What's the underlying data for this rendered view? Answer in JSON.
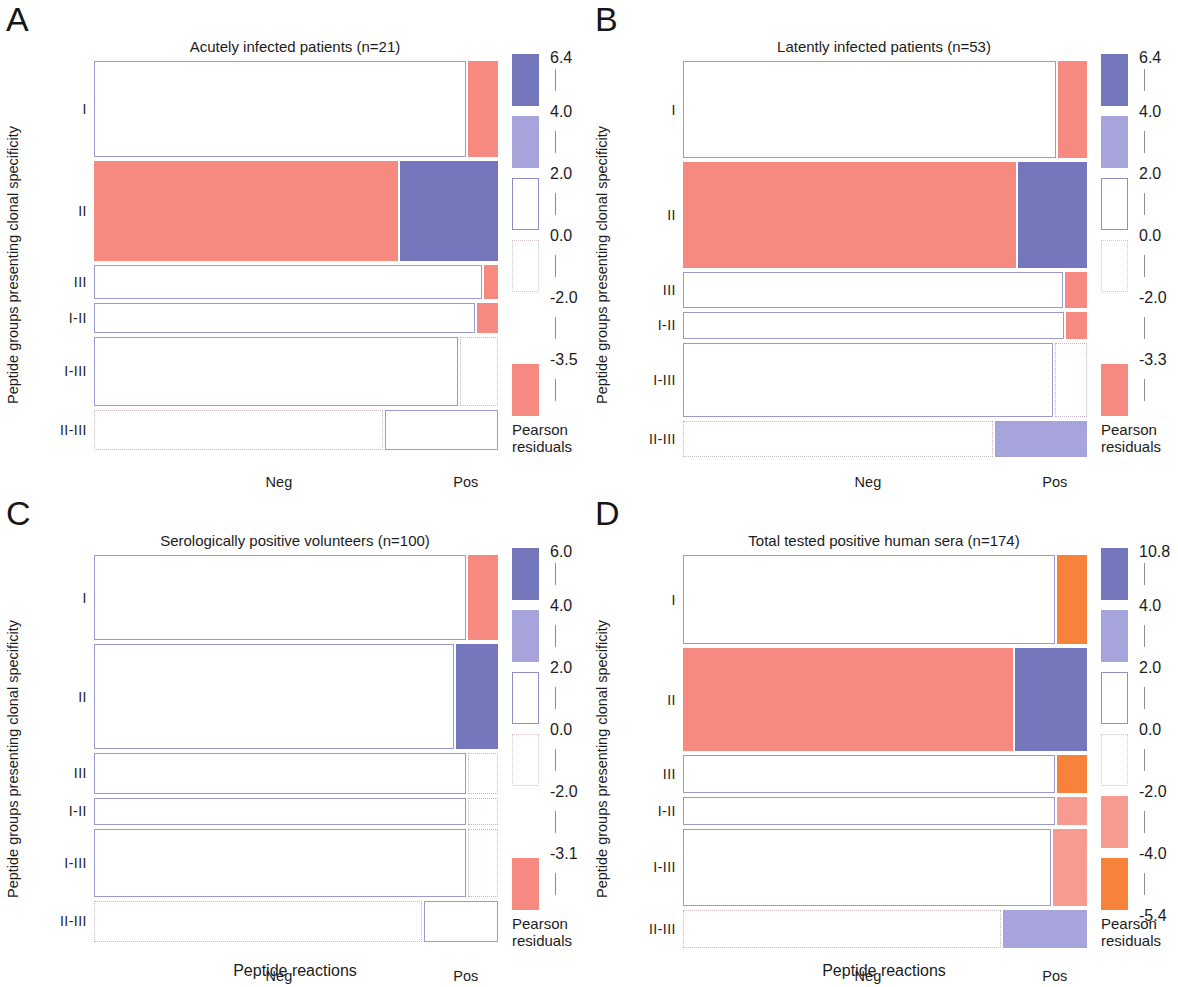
{
  "figure": {
    "xlabel": "Peptide reactions",
    "ylabel": "Peptide groups presenting clonal specificity",
    "xticks": [
      "Neg",
      "Pos"
    ],
    "legend_caption_line1": "Pearson",
    "legend_caption_line2": "residuals",
    "row_categories": [
      "I",
      "II",
      "III",
      "I-II",
      "I-III",
      "II-III"
    ],
    "colors": {
      "dark_blue": "#7577bd",
      "light_blue": "#a6a4db",
      "salmon": "#f68a80",
      "light_salmon": "#f79a90",
      "orange": "#f7823c",
      "white": "#ffffff",
      "solid_outline": "#9a9ad0",
      "dotted_outline": "#cdb6c3"
    }
  },
  "panels": [
    {
      "letter": "A",
      "title": "Acutely infected patients (n=21)",
      "legend": {
        "ticks": [
          "6.4",
          "4.0",
          "2.0",
          "0.0",
          "-2.0",
          "-3.5"
        ],
        "bands": [
          "dark_blue",
          "light_blue",
          "white_solid",
          "white_dotted",
          "gap",
          "salmon"
        ]
      },
      "chart_data": {
        "type": "mosaic",
        "title": "Acutely infected patients (n=21)",
        "xlabel": "Peptide reactions",
        "ylabel": "Peptide groups presenting clonal specificity",
        "columns": [
          "Neg",
          "Pos"
        ],
        "rows": [
          "I",
          "II",
          "III",
          "I-II",
          "I-III",
          "II-III"
        ],
        "row_heights_pct": [
          24.8,
          25.8,
          8.8,
          7.6,
          17.7,
          10.5
        ],
        "cells": [
          {
            "row": "I",
            "col": "Neg",
            "width_pct": 92.5,
            "residual_band": "0 to 2",
            "fill": "white",
            "border": "solid"
          },
          {
            "row": "I",
            "col": "Pos",
            "width_pct": 7.5,
            "residual_band": "-3.5 to -2",
            "fill": "salmon",
            "border": "none"
          },
          {
            "row": "II",
            "col": "Neg",
            "width_pct": 75.6,
            "residual_band": "-3.5 to -2",
            "fill": "salmon",
            "border": "none"
          },
          {
            "row": "II",
            "col": "Pos",
            "width_pct": 24.4,
            "residual_band": "4 to 6.4",
            "fill": "dark_blue",
            "border": "none"
          },
          {
            "row": "III",
            "col": "Neg",
            "width_pct": 96.5,
            "residual_band": "0 to 2",
            "fill": "white",
            "border": "solid"
          },
          {
            "row": "III",
            "col": "Pos",
            "width_pct": 3.5,
            "residual_band": "-3.5 to -2",
            "fill": "salmon",
            "border": "none"
          },
          {
            "row": "I-II",
            "col": "Neg",
            "width_pct": 94.8,
            "residual_band": "0 to 2",
            "fill": "white",
            "border": "solid"
          },
          {
            "row": "I-II",
            "col": "Pos",
            "width_pct": 5.2,
            "residual_band": "-3.5 to -2",
            "fill": "salmon",
            "border": "none"
          },
          {
            "row": "I-III",
            "col": "Neg",
            "width_pct": 90.5,
            "residual_band": "0 to 2",
            "fill": "white",
            "border": "solid"
          },
          {
            "row": "I-III",
            "col": "Pos",
            "width_pct": 9.5,
            "residual_band": "-2 to 0",
            "fill": "white",
            "border": "dotted"
          },
          {
            "row": "II-III",
            "col": "Neg",
            "width_pct": 72.0,
            "residual_band": "-2 to 0",
            "fill": "white",
            "border": "dotted"
          },
          {
            "row": "II-III",
            "col": "Pos",
            "width_pct": 28.0,
            "residual_band": "0 to 2",
            "fill": "white",
            "border": "solid"
          }
        ]
      }
    },
    {
      "letter": "B",
      "title": "Latently infected patients (n=53)",
      "legend": {
        "ticks": [
          "6.4",
          "4.0",
          "2.0",
          "0.0",
          "-2.0",
          "-3.3"
        ],
        "bands": [
          "dark_blue",
          "light_blue",
          "white_solid",
          "white_dotted",
          "gap",
          "salmon"
        ]
      },
      "chart_data": {
        "type": "mosaic",
        "title": "Latently infected patients (n=53)",
        "xlabel": "Peptide reactions",
        "ylabel": "Peptide groups presenting clonal specificity",
        "columns": [
          "Neg",
          "Pos"
        ],
        "rows": [
          "I",
          "II",
          "III",
          "I-II",
          "I-III",
          "II-III"
        ],
        "row_heights_pct": [
          25.0,
          27.2,
          9.3,
          7.1,
          19.1,
          9.3
        ],
        "cells": [
          {
            "row": "I",
            "col": "Neg",
            "width_pct": 92.8,
            "residual_band": "0 to 2",
            "fill": "white",
            "border": "solid"
          },
          {
            "row": "I",
            "col": "Pos",
            "width_pct": 7.2,
            "residual_band": "-3.3 to -2",
            "fill": "salmon",
            "border": "none"
          },
          {
            "row": "II",
            "col": "Neg",
            "width_pct": 82.8,
            "residual_band": "-3.3 to -2",
            "fill": "salmon",
            "border": "none"
          },
          {
            "row": "II",
            "col": "Pos",
            "width_pct": 17.2,
            "residual_band": "4 to 6.4",
            "fill": "dark_blue",
            "border": "none"
          },
          {
            "row": "III",
            "col": "Neg",
            "width_pct": 94.5,
            "residual_band": "0 to 2",
            "fill": "white",
            "border": "solid"
          },
          {
            "row": "III",
            "col": "Pos",
            "width_pct": 5.5,
            "residual_band": "-3.3 to -2",
            "fill": "salmon",
            "border": "none"
          },
          {
            "row": "I-II",
            "col": "Neg",
            "width_pct": 94.8,
            "residual_band": "0 to 2",
            "fill": "white",
            "border": "solid"
          },
          {
            "row": "I-II",
            "col": "Pos",
            "width_pct": 5.2,
            "residual_band": "-3.3 to -2",
            "fill": "salmon",
            "border": "none"
          },
          {
            "row": "I-III",
            "col": "Neg",
            "width_pct": 92.0,
            "residual_band": "0 to 2",
            "fill": "white",
            "border": "solid"
          },
          {
            "row": "I-III",
            "col": "Pos",
            "width_pct": 8.0,
            "residual_band": "-2 to 0",
            "fill": "white",
            "border": "dotted"
          },
          {
            "row": "II-III",
            "col": "Neg",
            "width_pct": 77.0,
            "residual_band": "-2 to 0",
            "fill": "white",
            "border": "dotted"
          },
          {
            "row": "II-III",
            "col": "Pos",
            "width_pct": 23.0,
            "residual_band": "2 to 4",
            "fill": "light_blue",
            "border": "none"
          }
        ]
      }
    },
    {
      "letter": "C",
      "title": "Serologically positive volunteers (n=100)",
      "legend": {
        "ticks": [
          "6.0",
          "4.0",
          "2.0",
          "0.0",
          "-2.0",
          "-3.1"
        ],
        "bands": [
          "dark_blue",
          "light_blue",
          "white_solid",
          "white_dotted",
          "gap",
          "salmon"
        ]
      },
      "chart_data": {
        "type": "mosaic",
        "title": "Serologically positive volunteers (n=100)",
        "xlabel": "Peptide reactions",
        "ylabel": "Peptide groups presenting clonal specificity",
        "columns": [
          "Neg",
          "Pos"
        ],
        "rows": [
          "I",
          "II",
          "III",
          "I-II",
          "I-III",
          "II-III"
        ],
        "row_heights_pct": [
          22.0,
          27.0,
          10.5,
          7.0,
          17.5,
          10.5
        ],
        "cells": [
          {
            "row": "I",
            "col": "Neg",
            "width_pct": 92.5,
            "residual_band": "0 to 2",
            "fill": "white",
            "border": "solid"
          },
          {
            "row": "I",
            "col": "Pos",
            "width_pct": 7.5,
            "residual_band": "-3.1 to -2",
            "fill": "salmon",
            "border": "none"
          },
          {
            "row": "II",
            "col": "Neg",
            "width_pct": 89.5,
            "residual_band": "0 to 2",
            "fill": "white",
            "border": "solid"
          },
          {
            "row": "II",
            "col": "Pos",
            "width_pct": 10.5,
            "residual_band": "4 to 6.0",
            "fill": "dark_blue",
            "border": "none"
          },
          {
            "row": "III",
            "col": "Neg",
            "width_pct": 92.5,
            "residual_band": "0 to 2",
            "fill": "white",
            "border": "solid"
          },
          {
            "row": "III",
            "col": "Pos",
            "width_pct": 7.5,
            "residual_band": "-2 to 0",
            "fill": "white",
            "border": "dotted"
          },
          {
            "row": "I-II",
            "col": "Neg",
            "width_pct": 92.5,
            "residual_band": "0 to 2",
            "fill": "white",
            "border": "solid"
          },
          {
            "row": "I-II",
            "col": "Pos",
            "width_pct": 7.5,
            "residual_band": "-2 to 0",
            "fill": "white",
            "border": "dotted"
          },
          {
            "row": "I-III",
            "col": "Neg",
            "width_pct": 92.5,
            "residual_band": "0 to 2",
            "fill": "white",
            "border": "solid"
          },
          {
            "row": "I-III",
            "col": "Pos",
            "width_pct": 7.5,
            "residual_band": "-2 to 0",
            "fill": "white",
            "border": "dotted"
          },
          {
            "row": "II-III",
            "col": "Neg",
            "width_pct": 81.5,
            "residual_band": "-2 to 0",
            "fill": "white",
            "border": "dotted"
          },
          {
            "row": "II-III",
            "col": "Pos",
            "width_pct": 18.5,
            "residual_band": "0 to 2",
            "fill": "white",
            "border": "solid"
          }
        ]
      }
    },
    {
      "letter": "D",
      "title": "Total tested positive human sera (n=174)",
      "legend": {
        "ticks": [
          "10.8",
          "4.0",
          "2.0",
          "0.0",
          "-2.0",
          "-4.0",
          "-5.4"
        ],
        "bands": [
          "dark_blue",
          "light_blue",
          "white_solid",
          "white_dotted",
          "light_salmon",
          "orange"
        ]
      },
      "chart_data": {
        "type": "mosaic",
        "title": "Total tested positive human sera (n=174)",
        "xlabel": "Peptide reactions",
        "ylabel": "Peptide groups presenting clonal specificity",
        "columns": [
          "Neg",
          "Pos"
        ],
        "rows": [
          "I",
          "II",
          "III",
          "I-II",
          "I-III",
          "II-III"
        ],
        "row_heights_pct": [
          23.0,
          26.5,
          9.8,
          7.1,
          20.0,
          9.8
        ],
        "cells": [
          {
            "row": "I",
            "col": "Neg",
            "width_pct": 92.5,
            "residual_band": "-5.4 to -4",
            "fill": "white",
            "border": "solid"
          },
          {
            "row": "I",
            "col": "Pos",
            "width_pct": 7.5,
            "residual_band": "-5.4 to -4",
            "fill": "orange",
            "border": "none"
          },
          {
            "row": "II",
            "col": "Neg",
            "width_pct": 82.0,
            "residual_band": "-4 to -2",
            "fill": "salmon",
            "border": "none"
          },
          {
            "row": "II",
            "col": "Pos",
            "width_pct": 18.0,
            "residual_band": "4 to 10.8",
            "fill": "dark_blue",
            "border": "none"
          },
          {
            "row": "III",
            "col": "Neg",
            "width_pct": 92.5,
            "residual_band": "0 to 2",
            "fill": "white",
            "border": "solid"
          },
          {
            "row": "III",
            "col": "Pos",
            "width_pct": 7.5,
            "residual_band": "-5.4 to -4",
            "fill": "orange",
            "border": "none"
          },
          {
            "row": "I-II",
            "col": "Neg",
            "width_pct": 92.5,
            "residual_band": "0 to 2",
            "fill": "white",
            "border": "solid"
          },
          {
            "row": "I-II",
            "col": "Pos",
            "width_pct": 7.5,
            "residual_band": "-4 to -2",
            "fill": "light_salmon",
            "border": "none"
          },
          {
            "row": "I-III",
            "col": "Neg",
            "width_pct": 91.5,
            "residual_band": "0 to 2",
            "fill": "white",
            "border": "solid"
          },
          {
            "row": "I-III",
            "col": "Pos",
            "width_pct": 8.5,
            "residual_band": "-4 to -2",
            "fill": "light_salmon",
            "border": "none"
          },
          {
            "row": "II-III",
            "col": "Neg",
            "width_pct": 79.0,
            "residual_band": "-2 to 0",
            "fill": "white",
            "border": "dotted"
          },
          {
            "row": "II-III",
            "col": "Pos",
            "width_pct": 21.0,
            "residual_band": "2 to 4",
            "fill": "light_blue",
            "border": "none"
          }
        ]
      }
    }
  ]
}
